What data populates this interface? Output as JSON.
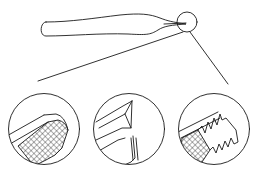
{
  "diagram": {
    "colors": {
      "line": "#1a1a1a",
      "background": "#ffffff"
    },
    "main_view": {
      "object": "tweezers-side-view",
      "magnifier": {
        "cx": 187,
        "cy": 22,
        "r": 10
      }
    },
    "callout_lines": [
      {
        "from": [
          183,
          32
        ],
        "to": [
          38,
          81
        ]
      },
      {
        "from": [
          190,
          32
        ],
        "to": [
          228,
          84
        ]
      }
    ],
    "details": [
      {
        "id": "detail-1",
        "label": "cross-hatched grip tip",
        "cx": 44,
        "cy": 129,
        "r": 36
      },
      {
        "id": "detail-2",
        "label": "angled pointed tip",
        "cx": 129,
        "cy": 129,
        "r": 36
      },
      {
        "id": "detail-3",
        "label": "serrated tip with cross-hatched pad",
        "cx": 214,
        "cy": 129,
        "r": 36
      }
    ]
  }
}
